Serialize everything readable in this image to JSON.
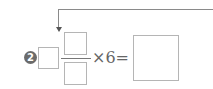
{
  "problem": {
    "number": "2",
    "operator": "×",
    "multiplier": "6",
    "equals": "=",
    "expression_text": "×6="
  },
  "blanks": {
    "whole_number": "",
    "numerator": "",
    "denominator": "",
    "answer": ""
  },
  "colors": {
    "badge_bg": "#6b6b6b",
    "box_border": "#b5b5b5",
    "arrow": "#8a8a8a",
    "text": "#666666"
  }
}
